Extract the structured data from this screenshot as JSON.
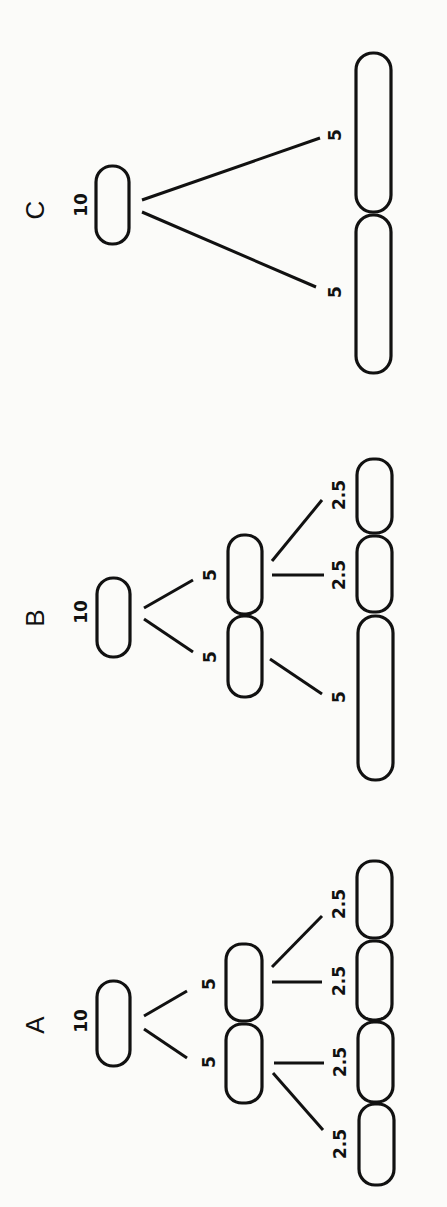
{
  "figure": {
    "orientation": "rotated 90 degrees counter-clockwise",
    "panels": [
      {
        "id": "C",
        "label": "C",
        "root": {
          "value": "10"
        },
        "generations": [
          {
            "cells": [
              "5",
              "5"
            ]
          }
        ],
        "labels": {
          "root": "10",
          "gen1_a": "5",
          "gen1_b": "5"
        }
      },
      {
        "id": "B",
        "label": "B",
        "root": {
          "value": "10"
        },
        "generations": [
          {
            "cells": [
              "5",
              "5"
            ]
          },
          {
            "cells": [
              "2.5",
              "2.5",
              "5"
            ]
          }
        ],
        "labels": {
          "root": "10",
          "gen1_a": "5",
          "gen1_b": "5",
          "gen2_a": "2.5",
          "gen2_b": "2.5",
          "gen2_c": "5"
        }
      },
      {
        "id": "A",
        "label": "A",
        "root": {
          "value": "10"
        },
        "generations": [
          {
            "cells": [
              "5",
              "5"
            ]
          },
          {
            "cells": [
              "2.5",
              "2.5",
              "2.5",
              "2.5"
            ]
          }
        ],
        "labels": {
          "root": "10",
          "gen1_a": "5",
          "gen1_b": "5",
          "gen2_a": "2.5",
          "gen2_b": "2.5",
          "gen2_c": "2.5",
          "gen2_d": "2.5"
        }
      }
    ]
  },
  "colors": {
    "ink": "#111111",
    "paper": "#fbfbf9"
  }
}
